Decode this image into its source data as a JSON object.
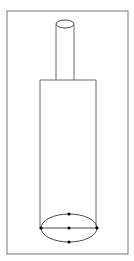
{
  "diagram": {
    "stroke_color": "#333333",
    "frame_color": "#777777",
    "dot_color": "#000000",
    "labels": []
  }
}
